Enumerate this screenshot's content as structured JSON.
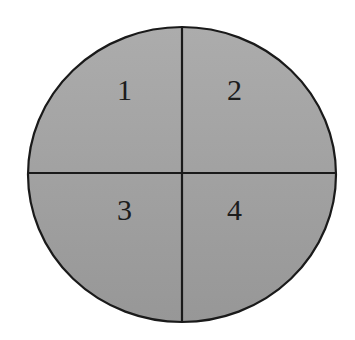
{
  "diagram": {
    "shape": "circle divided into four quadrants",
    "colors": {
      "background": "#ffffff",
      "fill_top": "#a9a9a9",
      "fill_bottom": "#9b9b9b",
      "stroke": "#1a1a1a",
      "label": "#1c1c1c"
    },
    "quadrants": [
      {
        "id": "top-left",
        "label": "1"
      },
      {
        "id": "top-right",
        "label": "2"
      },
      {
        "id": "bottom-left",
        "label": "3"
      },
      {
        "id": "bottom-right",
        "label": "4"
      }
    ]
  }
}
